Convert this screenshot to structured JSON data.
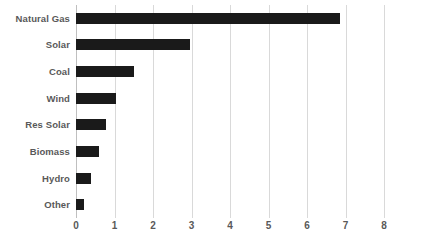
{
  "chart_data": {
    "type": "bar",
    "orientation": "horizontal",
    "title": "",
    "subtitle": "",
    "xlabel": "",
    "ylabel": "",
    "categories": [
      "Natural Gas",
      "Solar",
      "Coal",
      "Wind",
      "Res Solar",
      "Biomass",
      "Hydro",
      "Other"
    ],
    "values": [
      6.85,
      2.95,
      1.5,
      1.03,
      0.79,
      0.61,
      0.4,
      0.22
    ],
    "xlim": [
      0,
      8
    ],
    "xticks": [
      0,
      1,
      2,
      3,
      4,
      5,
      6,
      7,
      8
    ],
    "xtick_labels": [
      "0",
      "1",
      "2",
      "3",
      "4",
      "5",
      "6",
      "7",
      "8"
    ],
    "grid": true,
    "grid_axis": "x",
    "legend": false,
    "legend_position": "none",
    "bar_color": "#1a1a1a",
    "grid_color": "#d9d9d9",
    "axis_color": "#bfbfbf",
    "label_color": "#595959",
    "background_color": "#ffffff"
  }
}
